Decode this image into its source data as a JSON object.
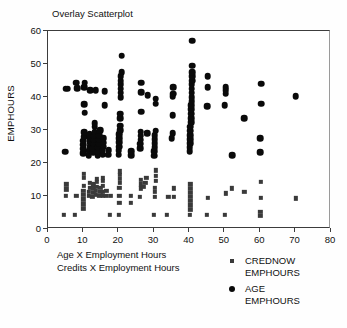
{
  "chart_data": {
    "type": "scatter",
    "title": "Overlay Scatterplot",
    "xlabel": "",
    "ylabel": "EMPHOURS",
    "xlim": [
      0,
      80
    ],
    "ylim": [
      0,
      60
    ],
    "xticks": [
      0,
      10,
      20,
      30,
      40,
      50,
      60,
      70,
      80
    ],
    "yticks": [
      0,
      10,
      20,
      30,
      40,
      50,
      60
    ],
    "grid": false,
    "legend_position": "bottom-right",
    "caption_lines": [
      "Age X Employment Hours",
      "Credits X Employment Hours"
    ],
    "series": [
      {
        "name": "CREDNOW EMPHOURS",
        "marker": "square",
        "color": "#3a3a3a",
        "points": [
          [
            4.5,
            4.2
          ],
          [
            5.0,
            10.0
          ],
          [
            5.2,
            12.0
          ],
          [
            5.2,
            13.5
          ],
          [
            7.5,
            4.2
          ],
          [
            8.0,
            10.0
          ],
          [
            10.0,
            6.2
          ],
          [
            10.0,
            7.5
          ],
          [
            10.0,
            9.0
          ],
          [
            10.0,
            10.3
          ],
          [
            10.0,
            11.5
          ],
          [
            10.2,
            13.0
          ],
          [
            10.2,
            15.5
          ],
          [
            10.2,
            16.8
          ],
          [
            11.5,
            10.0
          ],
          [
            11.5,
            11.3
          ],
          [
            11.8,
            12.5
          ],
          [
            11.8,
            14.0
          ],
          [
            12.5,
            9.8
          ],
          [
            12.8,
            11.0
          ],
          [
            12.8,
            12.3
          ],
          [
            12.8,
            13.5
          ],
          [
            13.5,
            10.3
          ],
          [
            13.5,
            11.5
          ],
          [
            13.8,
            12.8
          ],
          [
            13.8,
            14.2
          ],
          [
            13.8,
            15.2
          ],
          [
            14.5,
            10.0
          ],
          [
            14.8,
            11.2
          ],
          [
            14.8,
            12.5
          ],
          [
            15.5,
            10.0
          ],
          [
            15.5,
            11.3
          ],
          [
            15.5,
            13.0
          ],
          [
            15.5,
            14.5
          ],
          [
            15.5,
            15.5
          ],
          [
            16.5,
            10.0
          ],
          [
            16.5,
            11.5
          ],
          [
            17.5,
            4.2
          ],
          [
            17.8,
            10.0
          ],
          [
            20.0,
            4.2
          ],
          [
            20.2,
            8.0
          ],
          [
            20.2,
            10.0
          ],
          [
            20.2,
            12.5
          ],
          [
            20.4,
            14.0
          ],
          [
            20.4,
            15.3
          ],
          [
            20.4,
            16.5
          ],
          [
            20.4,
            17.5
          ],
          [
            23.5,
            8.0
          ],
          [
            23.5,
            10.0
          ],
          [
            26.0,
            9.8
          ],
          [
            26.2,
            12.3
          ],
          [
            26.2,
            13.5
          ],
          [
            26.2,
            15.0
          ],
          [
            27.0,
            12.8
          ],
          [
            27.5,
            14.0
          ],
          [
            27.8,
            15.5
          ],
          [
            30.0,
            4.2
          ],
          [
            30.2,
            9.8
          ],
          [
            30.2,
            11.2
          ],
          [
            30.2,
            12.5
          ],
          [
            30.4,
            14.5
          ],
          [
            30.4,
            16.0
          ],
          [
            30.4,
            17.8
          ],
          [
            33.5,
            4.2
          ],
          [
            34.0,
            9.8
          ],
          [
            35.5,
            9.8
          ],
          [
            35.5,
            12.3
          ],
          [
            40.0,
            4.2
          ],
          [
            40.2,
            5.8
          ],
          [
            40.2,
            7.2
          ],
          [
            40.2,
            8.5
          ],
          [
            40.2,
            9.8
          ],
          [
            40.2,
            11.0
          ],
          [
            40.2,
            12.2
          ],
          [
            40.2,
            13.5
          ],
          [
            45.0,
            4.2
          ],
          [
            45.2,
            9.5
          ],
          [
            50.0,
            4.2
          ],
          [
            50.2,
            10.8
          ],
          [
            52.0,
            12.3
          ],
          [
            55.5,
            11.2
          ],
          [
            60.0,
            4.0
          ],
          [
            60.0,
            5.2
          ],
          [
            60.2,
            9.5
          ],
          [
            60.2,
            14.3
          ],
          [
            70.0,
            9.3
          ]
        ]
      },
      {
        "name": "AGE EMPHOURS",
        "marker": "circle",
        "color": "#0a0a0a",
        "points": [
          [
            4.8,
            23.4
          ],
          [
            5.0,
            42.5
          ],
          [
            5.6,
            42.5
          ],
          [
            8.0,
            44.3
          ],
          [
            8.2,
            42.6
          ],
          [
            10.0,
            23.0
          ],
          [
            10.0,
            24.3
          ],
          [
            10.0,
            25.5
          ],
          [
            10.0,
            26.8
          ],
          [
            10.2,
            28.0
          ],
          [
            10.2,
            29.3
          ],
          [
            10.2,
            37.8
          ],
          [
            10.2,
            43.0
          ],
          [
            10.4,
            44.3
          ],
          [
            10.4,
            35.2
          ],
          [
            11.5,
            22.4
          ],
          [
            11.5,
            23.7
          ],
          [
            11.8,
            25.0
          ],
          [
            11.8,
            26.3
          ],
          [
            11.8,
            27.5
          ],
          [
            11.8,
            28.8
          ],
          [
            12.0,
            42.0
          ],
          [
            12.8,
            23.2
          ],
          [
            12.8,
            24.5
          ],
          [
            13.0,
            25.8
          ],
          [
            13.0,
            27.0
          ],
          [
            13.0,
            28.3
          ],
          [
            13.2,
            29.5
          ],
          [
            13.2,
            31.0
          ],
          [
            13.2,
            32.0
          ],
          [
            13.5,
            42.0
          ],
          [
            14.0,
            22.2
          ],
          [
            14.2,
            23.5
          ],
          [
            14.2,
            24.8
          ],
          [
            14.5,
            26.0
          ],
          [
            14.5,
            27.3
          ],
          [
            14.5,
            28.5
          ],
          [
            14.8,
            30.0
          ],
          [
            15.5,
            22.5
          ],
          [
            15.5,
            23.8
          ],
          [
            15.8,
            25.0
          ],
          [
            15.8,
            26.2
          ],
          [
            15.8,
            27.5
          ],
          [
            16.0,
            37.6
          ],
          [
            16.0,
            41.8
          ],
          [
            17.0,
            22.5
          ],
          [
            17.2,
            23.8
          ],
          [
            20.0,
            22.5
          ],
          [
            20.0,
            23.8
          ],
          [
            20.2,
            25.0
          ],
          [
            20.2,
            26.3
          ],
          [
            20.2,
            27.5
          ],
          [
            20.2,
            28.8
          ],
          [
            20.4,
            30.0
          ],
          [
            20.4,
            31.3
          ],
          [
            20.4,
            33.5
          ],
          [
            20.4,
            35.0
          ],
          [
            20.6,
            40.0
          ],
          [
            20.6,
            41.3
          ],
          [
            20.6,
            42.5
          ],
          [
            20.6,
            43.8
          ],
          [
            20.6,
            45.0
          ],
          [
            20.6,
            46.3
          ],
          [
            20.8,
            47.5
          ],
          [
            20.8,
            52.5
          ],
          [
            23.5,
            22.3
          ],
          [
            23.5,
            23.6
          ],
          [
            26.0,
            24.5
          ],
          [
            26.0,
            25.8
          ],
          [
            26.2,
            27.0
          ],
          [
            26.2,
            28.3
          ],
          [
            26.2,
            29.5
          ],
          [
            26.4,
            35.5
          ],
          [
            26.4,
            41.5
          ],
          [
            26.4,
            44.3
          ],
          [
            28.0,
            29.0
          ],
          [
            28.2,
            40.5
          ],
          [
            30.0,
            22.2
          ],
          [
            30.0,
            23.5
          ],
          [
            30.2,
            24.8
          ],
          [
            30.2,
            26.0
          ],
          [
            30.2,
            27.3
          ],
          [
            30.2,
            28.5
          ],
          [
            30.4,
            29.8
          ],
          [
            30.4,
            38.0
          ],
          [
            30.4,
            39.5
          ],
          [
            35.0,
            27.5
          ],
          [
            35.2,
            29.0
          ],
          [
            35.2,
            34.5
          ],
          [
            35.2,
            40.3
          ],
          [
            35.4,
            41.0
          ],
          [
            35.4,
            43.0
          ],
          [
            40.0,
            23.5
          ],
          [
            40.0,
            24.8
          ],
          [
            40.2,
            26.0
          ],
          [
            40.2,
            27.3
          ],
          [
            40.2,
            28.5
          ],
          [
            40.2,
            29.8
          ],
          [
            40.2,
            31.0
          ],
          [
            40.4,
            32.3
          ],
          [
            40.4,
            33.5
          ],
          [
            40.4,
            35.0
          ],
          [
            40.4,
            36.3
          ],
          [
            40.4,
            37.5
          ],
          [
            40.6,
            38.8
          ],
          [
            40.6,
            40.0
          ],
          [
            40.6,
            41.3
          ],
          [
            40.6,
            42.5
          ],
          [
            40.6,
            43.8
          ],
          [
            40.8,
            45.0
          ],
          [
            40.8,
            46.3
          ],
          [
            40.8,
            47.5
          ],
          [
            40.8,
            49.5
          ],
          [
            40.8,
            57.0
          ],
          [
            45.0,
            37.3
          ],
          [
            45.2,
            43.0
          ],
          [
            45.2,
            46.3
          ],
          [
            50.0,
            37.5
          ],
          [
            50.2,
            41.0
          ],
          [
            50.2,
            42.0
          ],
          [
            50.2,
            43.0
          ],
          [
            52.0,
            22.4
          ],
          [
            55.5,
            33.5
          ],
          [
            60.0,
            23.2
          ],
          [
            60.0,
            27.5
          ],
          [
            60.2,
            38.0
          ],
          [
            60.2,
            44.0
          ],
          [
            70.0,
            40.2
          ]
        ]
      }
    ]
  }
}
